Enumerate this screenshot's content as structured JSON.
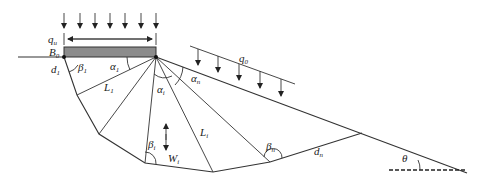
{
  "diagram": {
    "type": "slope-bearing-capacity-failure-mechanism",
    "labels": {
      "q_u": "q",
      "q_u_sub": "u",
      "B_0": "B",
      "B_0_sub": "0",
      "d_1": "d",
      "d_1_sub": "1",
      "beta_1": "β",
      "beta_1_sub": "1",
      "alpha_1": "α",
      "alpha_1_sub": "1",
      "L_1": "L",
      "L_1_sub": "1",
      "alpha_i": "α",
      "alpha_i_sub": "i",
      "alpha_n": "α",
      "alpha_n_sub": "n",
      "q_0": "q",
      "q_0_sub": "0",
      "L_i": "L",
      "L_i_sub": "i",
      "beta_i": "β",
      "beta_i_sub": "i",
      "W_i": "W",
      "W_i_sub": "i",
      "beta_n": "β",
      "beta_n_sub": "n",
      "d_n": "d",
      "d_n_sub": "n",
      "theta": "θ"
    },
    "colors": {
      "foundation_fill": "#8c8c8c",
      "line": "#333333"
    }
  }
}
